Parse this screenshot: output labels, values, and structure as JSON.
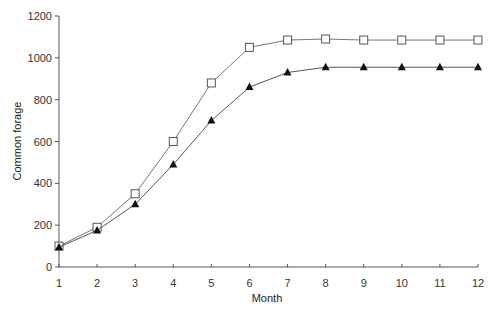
{
  "chart_data": {
    "type": "line",
    "title": "",
    "xlabel": "Month",
    "ylabel": "Common forage",
    "x": [
      1,
      2,
      3,
      4,
      5,
      6,
      7,
      8,
      9,
      10,
      11,
      12
    ],
    "xlim": [
      1,
      12
    ],
    "ylim": [
      0,
      1200
    ],
    "yticks": [
      0,
      200,
      400,
      600,
      800,
      1000,
      1200
    ],
    "xticks": [
      1,
      2,
      3,
      4,
      5,
      6,
      7,
      8,
      9,
      10,
      11,
      12
    ],
    "grid": false,
    "legend": null,
    "series": [
      {
        "name": "Series 1 (open squares)",
        "marker": "open-square",
        "color": "#555555",
        "values": [
          100,
          190,
          350,
          600,
          880,
          1050,
          1085,
          1090,
          1085,
          1085,
          1085,
          1085
        ]
      },
      {
        "name": "Series 2 (filled triangles)",
        "marker": "filled-triangle",
        "color": "#111111",
        "values": [
          95,
          175,
          300,
          490,
          700,
          860,
          930,
          955,
          955,
          955,
          955,
          955
        ]
      }
    ]
  },
  "axes": {
    "x_title": "Month",
    "y_title": "Common forage"
  }
}
